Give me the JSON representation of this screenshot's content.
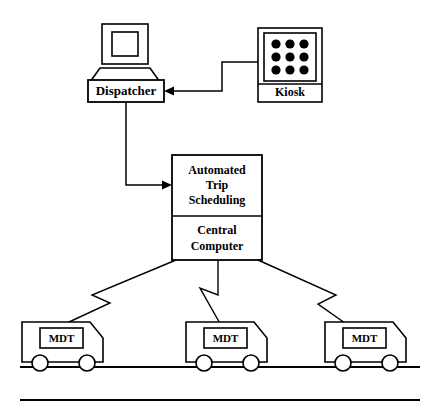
{
  "diagram": {
    "nodes": {
      "dispatcher": {
        "label": "Dispatcher",
        "icon": "desktop-computer-icon"
      },
      "kiosk": {
        "label": "Kiosk",
        "icon": "keypad-grid-icon",
        "keypad_dots": 9
      },
      "central": {
        "line1": "Automated",
        "line2": "Trip",
        "line3": "Scheduling",
        "line4": "Central",
        "line5": "Computer"
      },
      "vehicles": [
        {
          "label": "MDT",
          "name": "vehicle-left"
        },
        {
          "label": "MDT",
          "name": "vehicle-center"
        },
        {
          "label": "MDT",
          "name": "vehicle-right"
        }
      ]
    },
    "connections": [
      {
        "from": "kiosk",
        "to": "dispatcher",
        "style": "orthogonal-arrow"
      },
      {
        "from": "dispatcher",
        "to": "central",
        "style": "orthogonal-arrow"
      },
      {
        "from": "central",
        "to": "vehicle-left",
        "style": "zigzag-radio-arrow"
      },
      {
        "from": "central",
        "to": "vehicle-center",
        "style": "zigzag-radio-arrow"
      },
      {
        "from": "central",
        "to": "vehicle-right",
        "style": "zigzag-radio-arrow"
      }
    ],
    "colors": {
      "stroke": "#000000",
      "fill": "#ffffff",
      "background": "#ffffff"
    },
    "rules": [
      {
        "name": "ground-line"
      },
      {
        "name": "bottom-rule"
      }
    ]
  }
}
